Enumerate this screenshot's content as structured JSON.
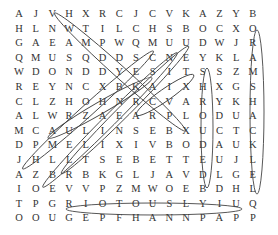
{
  "puzzle": {
    "type": "word-search",
    "rows": [
      [
        "A",
        "J",
        "V",
        "H",
        "X",
        "R",
        "C",
        "J",
        "C",
        "V",
        "K",
        "A",
        "Z",
        "Y",
        "B"
      ],
      [
        "H",
        "L",
        "N",
        "W",
        "T",
        "I",
        "L",
        "C",
        "H",
        "S",
        "B",
        "O",
        "C",
        "X",
        "O"
      ],
      [
        "G",
        "A",
        "E",
        "A",
        "M",
        "P",
        "W",
        "Q",
        "M",
        "U",
        "U",
        "D",
        "W",
        "J",
        "R"
      ],
      [
        "Q",
        "M",
        "U",
        "S",
        "Q",
        "D",
        "D",
        "S",
        "C",
        "N",
        "E",
        "Y",
        "K",
        "L",
        "A"
      ],
      [
        "W",
        "D",
        "O",
        "N",
        "D",
        "D",
        "Y",
        "E",
        "S",
        "I",
        "T",
        "S",
        "S",
        "Z",
        "M"
      ],
      [
        "R",
        "E",
        "Y",
        "N",
        "C",
        "X",
        "B",
        "K",
        "A",
        "I",
        "X",
        "H",
        "X",
        "G",
        "S"
      ],
      [
        "C",
        "L",
        "Z",
        "H",
        "O",
        "H",
        "N",
        "R",
        "C",
        "V",
        "A",
        "R",
        "Y",
        "K",
        "H"
      ],
      [
        "A",
        "L",
        "W",
        "R",
        "Z",
        "A",
        "E",
        "A",
        "R",
        "P",
        "L",
        "O",
        "D",
        "U",
        "A"
      ],
      [
        "M",
        "C",
        "A",
        "U",
        "L",
        "I",
        "N",
        "S",
        "E",
        "B",
        "X",
        "U",
        "C",
        "T",
        "C"
      ],
      [
        "D",
        "P",
        "M",
        "E",
        "L",
        "I",
        "X",
        "I",
        "V",
        "B",
        "O",
        "D",
        "A",
        "U",
        "K"
      ],
      [
        "J",
        "H",
        "L",
        "L",
        "T",
        "S",
        "E",
        "B",
        "E",
        "T",
        "T",
        "E",
        "U",
        "J",
        "L"
      ],
      [
        "A",
        "Z",
        "B",
        "R",
        "B",
        "K",
        "G",
        "L",
        "J",
        "A",
        "V",
        "D",
        "L",
        "G",
        "E"
      ],
      [
        "I",
        "O",
        "E",
        "V",
        "V",
        "P",
        "Z",
        "M",
        "W",
        "O",
        "E",
        "B",
        "D",
        "H",
        "L"
      ],
      [
        "T",
        "P",
        "G",
        "R",
        "I",
        "O",
        "T",
        "O",
        "U",
        "S",
        "L",
        "Y",
        "I",
        "U",
        "Q"
      ],
      [
        "O",
        "O",
        "U",
        "G",
        "E",
        "P",
        "F",
        "H",
        "A",
        "N",
        "N",
        "P",
        "A",
        "P",
        "P"
      ]
    ],
    "found_words_visible": [
      "RIOTOUSLY",
      "ORAMSHACKLE",
      "SHROUDED"
    ]
  }
}
